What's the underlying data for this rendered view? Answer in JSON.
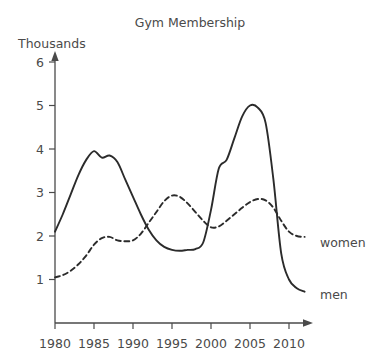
{
  "chart_data": {
    "type": "line",
    "title": "Gym Membership",
    "xlabel": "",
    "ylabel": "Thousands",
    "xlim": [
      1980,
      2012
    ],
    "ylim": [
      0,
      6.3
    ],
    "grid": false,
    "legend_position": "inline-right-end-of-line",
    "x_ticks": [
      "1980",
      "1985",
      "1990",
      "1995",
      "2000",
      "2005",
      "2010"
    ],
    "x_tick_values": [
      1980,
      1985,
      1990,
      1995,
      2000,
      2005,
      2010
    ],
    "y_ticks": [
      "1",
      "2",
      "3",
      "4",
      "5",
      "6"
    ],
    "y_tick_values": [
      1,
      2,
      3,
      4,
      5,
      6
    ],
    "x": [
      1980,
      1981,
      1982,
      1983,
      1984,
      1985,
      1986,
      1987,
      1988,
      1989,
      1990,
      1991,
      1992,
      1993,
      1994,
      1995,
      1996,
      1997,
      1998,
      1999,
      2000,
      2001,
      2002,
      2003,
      2004,
      2005,
      2006,
      2007,
      2008,
      2009,
      2010,
      2011,
      2012
    ],
    "series": [
      {
        "name": "men",
        "style": "solid",
        "label": "men",
        "values": [
          2.1,
          2.5,
          2.95,
          3.4,
          3.75,
          3.95,
          3.8,
          3.85,
          3.7,
          3.3,
          2.9,
          2.5,
          2.15,
          1.9,
          1.75,
          1.68,
          1.66,
          1.68,
          1.7,
          1.85,
          2.6,
          3.55,
          3.75,
          4.25,
          4.75,
          5.0,
          4.95,
          4.6,
          3.3,
          1.6,
          1.0,
          0.8,
          0.72
        ]
      },
      {
        "name": "women",
        "style": "dashed",
        "label": "women",
        "values": [
          1.05,
          1.1,
          1.2,
          1.35,
          1.55,
          1.8,
          1.95,
          1.98,
          1.9,
          1.88,
          1.9,
          2.05,
          2.3,
          2.55,
          2.8,
          2.93,
          2.9,
          2.75,
          2.55,
          2.35,
          2.2,
          2.22,
          2.35,
          2.5,
          2.65,
          2.78,
          2.85,
          2.82,
          2.65,
          2.35,
          2.1,
          2.0,
          1.98
        ]
      }
    ]
  },
  "labels": {
    "title": "Gym Membership",
    "y_axis_unit": "Thousands",
    "series_women": "women",
    "series_men": "men",
    "ytick_1": "1",
    "ytick_2": "2",
    "ytick_3": "3",
    "ytick_4": "4",
    "ytick_5": "5",
    "ytick_6": "6",
    "xtick_1980": "1980",
    "xtick_1985": "1985",
    "xtick_1990": "1990",
    "xtick_1995": "1995",
    "xtick_2000": "2000",
    "xtick_2005": "2005",
    "xtick_2010": "2010"
  },
  "colors": {
    "background": "#ffffff",
    "axis": "#4a4a4a",
    "line": "#2b2b2b",
    "text": "#4a4a4a"
  }
}
